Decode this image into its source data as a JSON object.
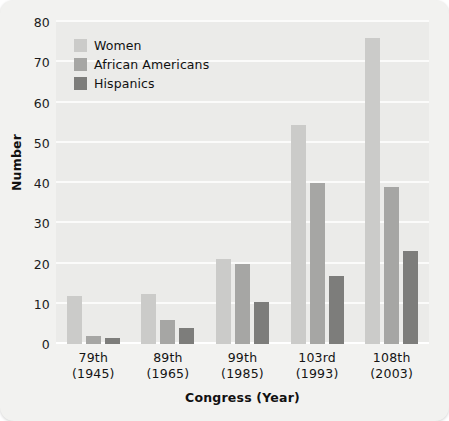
{
  "chart_data": {
    "type": "bar",
    "title": "",
    "xlabel": "Congress (Year)",
    "ylabel": "Number",
    "categories": [
      "79th\n(1945)",
      "89th\n(1965)",
      "99th\n(1985)",
      "103rd\n(1993)",
      "108th\n(2003)"
    ],
    "category_lines": [
      {
        "congress": "79th",
        "year": "(1945)"
      },
      {
        "congress": "89th",
        "year": "(1965)"
      },
      {
        "congress": "99th",
        "year": "(1985)"
      },
      {
        "congress": "103rd",
        "year": "(1993)"
      },
      {
        "congress": "108th",
        "year": "(2003)"
      }
    ],
    "series": [
      {
        "name": "Women",
        "color": "#cbcbc9",
        "values": [
          12,
          12.5,
          21,
          54.5,
          76
        ]
      },
      {
        "name": "African Americans",
        "color": "#a6a6a4",
        "values": [
          2,
          6,
          20,
          40,
          39
        ]
      },
      {
        "name": "Hispanics",
        "color": "#7d7d7b",
        "values": [
          1.5,
          4,
          10.5,
          17,
          23
        ]
      }
    ],
    "ylim": [
      0,
      80
    ],
    "yticks": [
      0,
      10,
      20,
      30,
      40,
      50,
      60,
      70,
      80
    ],
    "ytick_labels": [
      "0",
      "10",
      "20",
      "30",
      "40",
      "50",
      "60",
      "70",
      "80"
    ],
    "grid": true,
    "legend_position": "top-left"
  },
  "style": {
    "card_background": "#f2f2f0",
    "plot_background": "#ebebe9",
    "gridline_color": "#fbfbfa",
    "text_color": "#111111"
  }
}
